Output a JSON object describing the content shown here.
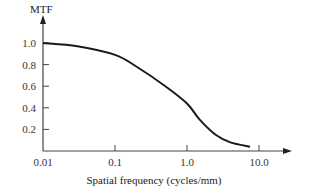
{
  "chart_data": {
    "type": "line",
    "title": "",
    "ylabel": "MTF",
    "xlabel": "Spatial frequency (cycles/mm)",
    "xscale": "log",
    "xlim": [
      0.01,
      10.0
    ],
    "ylim": [
      0,
      1.0
    ],
    "x_ticks": [
      "0.01",
      "0.1",
      "1.0",
      "10.0"
    ],
    "y_ticks": [
      "0.2",
      "0.4",
      "0.6",
      "0.8",
      "1.0"
    ],
    "grid": false,
    "legend": null,
    "series": [
      {
        "name": "MTF",
        "x": [
          0.01,
          0.03,
          0.1,
          0.2,
          0.5,
          1.0,
          1.5,
          2.5,
          4.0,
          7.5
        ],
        "y": [
          1.0,
          0.97,
          0.89,
          0.78,
          0.6,
          0.44,
          0.29,
          0.15,
          0.08,
          0.04
        ]
      }
    ]
  }
}
